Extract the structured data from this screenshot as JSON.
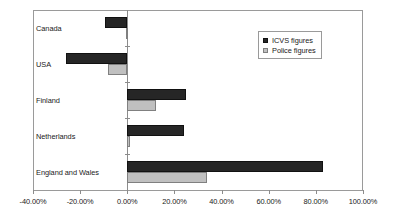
{
  "chart_data": {
    "type": "bar",
    "orientation": "horizontal",
    "title": "",
    "xlabel": "",
    "ylabel": "",
    "xlim": [
      -40,
      100
    ],
    "xticks": [
      -40,
      -20,
      0,
      20,
      40,
      60,
      80,
      100
    ],
    "xtick_labels": [
      "-40.00%",
      "-20.00%",
      "0.00%",
      "20.00%",
      "40.00%",
      "60.00%",
      "80.00%",
      "100.00%"
    ],
    "grid": false,
    "legend_position": "upper right",
    "categories": [
      "Canada",
      "USA",
      "Finland",
      "Netherlands",
      "England and Wales"
    ],
    "series": [
      {
        "name": "ICVS figures",
        "color": "#262626",
        "values": [
          -9.5,
          -26.0,
          25.0,
          24.0,
          83.0
        ]
      },
      {
        "name": "Police figures",
        "color": "#c0c0c0",
        "values": [
          -0.5,
          -8.0,
          12.0,
          1.0,
          34.0
        ]
      }
    ]
  },
  "legend": {
    "items": [
      {
        "label": "ICVS figures",
        "swatch": "icvs"
      },
      {
        "label": "Police figures",
        "swatch": "police"
      }
    ]
  }
}
